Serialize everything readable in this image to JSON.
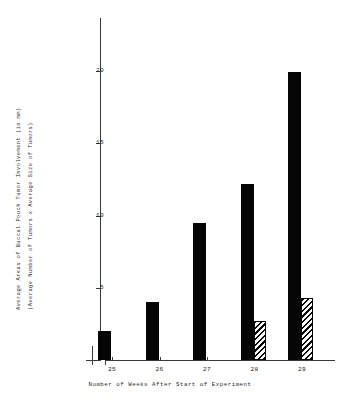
{
  "chart_data": {
    "type": "bar",
    "title": "",
    "xlabel": "Number of Weeks After Start of Experiment",
    "ylabel_line1": "Average Areas of Buccal Pouch Tumor Involvement (in mm)",
    "ylabel_line2": "(Average Number of Tumors x Average Size of Tumors)",
    "categories": [
      "25",
      "26",
      "27",
      "28",
      "29"
    ],
    "ylim": [
      0,
      22
    ],
    "yticks": [
      5,
      10,
      15,
      20
    ],
    "ytick_labels": [
      "5",
      "10",
      "15",
      "20"
    ],
    "grid": false,
    "legend": "none",
    "axis_break_on_x": true,
    "series": [
      {
        "name": "Average area of tumor involvement",
        "style": "solid-black",
        "values": [
          2.0,
          4.0,
          9.5,
          12.2,
          19.9
        ]
      },
      {
        "name": "Second measure",
        "style": "diagonal-hatch",
        "values": [
          null,
          null,
          null,
          2.7,
          4.3
        ]
      }
    ]
  }
}
